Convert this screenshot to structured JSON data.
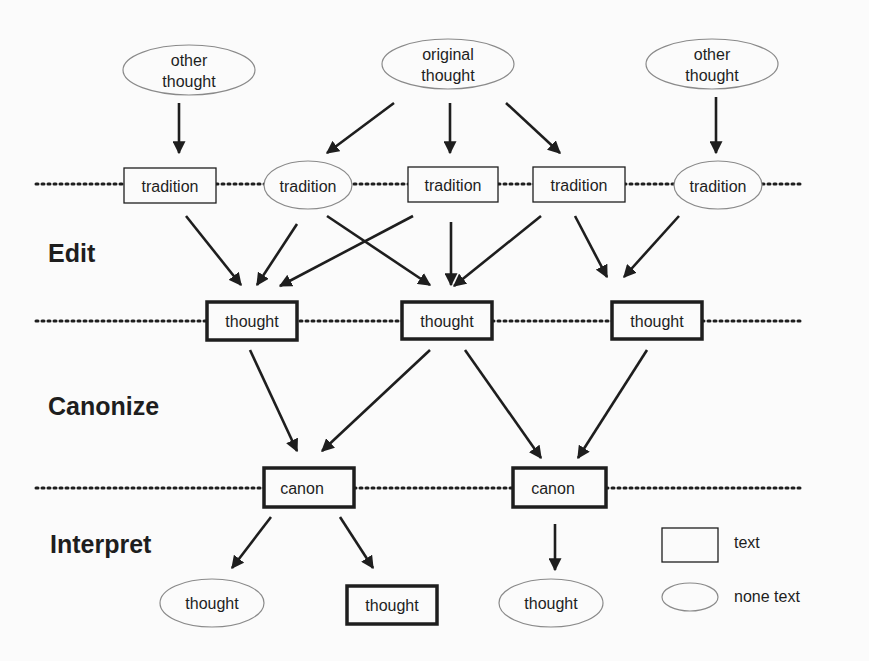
{
  "diagram": {
    "stages": {
      "edit": "Edit",
      "canonize": "Canonize",
      "interpret": "Interpret"
    },
    "sources": [
      {
        "label_line1": "other",
        "label_line2": "thought",
        "shape": "ellipse"
      },
      {
        "label_line1": "original",
        "label_line2": "thought",
        "shape": "ellipse"
      },
      {
        "label_line1": "other",
        "label_line2": "thought",
        "shape": "ellipse"
      }
    ],
    "traditions": [
      {
        "label": "tradition",
        "shape": "rect"
      },
      {
        "label": "tradition",
        "shape": "ellipse"
      },
      {
        "label": "tradition",
        "shape": "rect"
      },
      {
        "label": "tradition",
        "shape": "rect"
      },
      {
        "label": "tradition",
        "shape": "ellipse"
      }
    ],
    "thoughts": [
      {
        "label": "thought",
        "shape": "bold-rect"
      },
      {
        "label": "thought",
        "shape": "bold-rect"
      },
      {
        "label": "thought",
        "shape": "bold-rect"
      }
    ],
    "canons": [
      {
        "label": "canon",
        "shape": "bold-rect"
      },
      {
        "label": "canon",
        "shape": "bold-rect"
      }
    ],
    "interpretations": [
      {
        "label": "thought",
        "shape": "ellipse"
      },
      {
        "label": "thought",
        "shape": "bold-rect"
      },
      {
        "label": "thought",
        "shape": "ellipse"
      }
    ],
    "legend": {
      "rect_label": "text",
      "ellipse_label": "none text"
    },
    "colors": {
      "stroke": "#1e1e1e",
      "ellipse_stroke": "#8a8a8a",
      "background": "#fbfbfb"
    }
  }
}
